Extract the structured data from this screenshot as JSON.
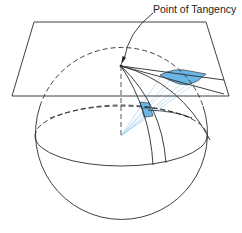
{
  "diagram": {
    "labels": {
      "tangency": "Point of Tangency"
    },
    "colors": {
      "line": "#2a2a2a",
      "fill_blue": "#6bb7e6",
      "ray_blue": "#a9d3ee",
      "background": "#ffffff"
    },
    "elements": [
      "tangent-plane",
      "sphere",
      "equator",
      "upper-parallel",
      "central-meridian",
      "meridians",
      "projection-rays",
      "projected-area-on-plane",
      "area-on-sphere"
    ]
  }
}
